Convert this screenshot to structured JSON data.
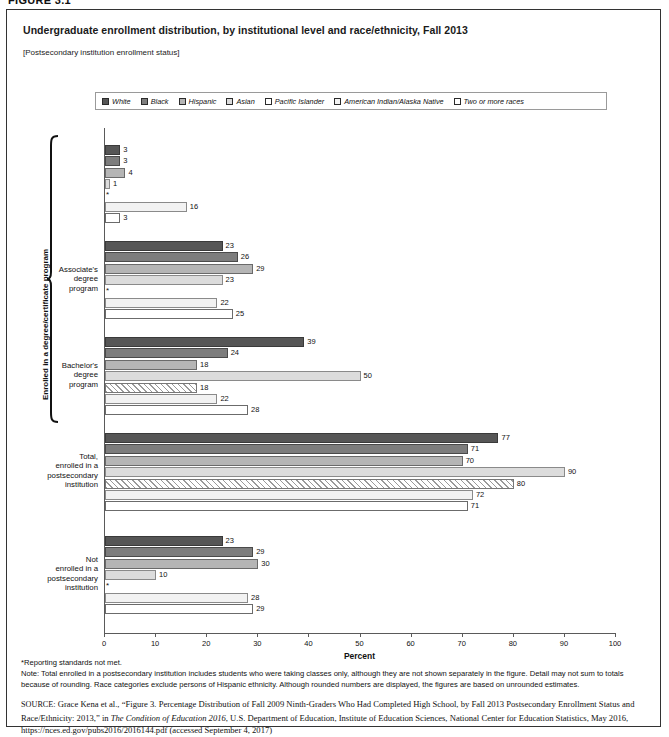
{
  "figure_tag": "FIGURE 3.1",
  "title": "Undergraduate enrollment distribution, by institutional level and race/ethnicity, Fall 2013",
  "subtitle": "[Postsecondary institution enrollment status]",
  "legend": {
    "items": [
      {
        "label": "White",
        "color": "#565656",
        "pattern": "solid"
      },
      {
        "label": "Black",
        "color": "#7d7d7d",
        "pattern": "solid"
      },
      {
        "label": "Hispanic",
        "color": "#b5b5b5",
        "pattern": "solid"
      },
      {
        "label": "Asian",
        "color": "#dcdcdc",
        "pattern": "solid"
      },
      {
        "label": "Pacific Islander",
        "color": "#ffffff",
        "pattern": "diagonal-hatch"
      },
      {
        "label": "American Indian/Alaska Native",
        "color": "#f2f2f2",
        "pattern": "solid"
      },
      {
        "label": "Two or more races",
        "color": "#ffffff",
        "pattern": "solid"
      }
    ]
  },
  "bracket_label": "Enrolled in a degree/certificate program",
  "axis": {
    "title": "Percent",
    "ticks": [
      "0",
      "10",
      "20",
      "30",
      "40",
      "50",
      "60",
      "70",
      "80",
      "90",
      "100"
    ],
    "min": 0,
    "max": 100
  },
  "notes": {
    "star": "*Reporting standards not met.",
    "body": "Note: Total enrolled in a postsecondary institution includes students who were taking classes only, although they are not shown separately in the figure. Detail may not sum to totals because of rounding. Race categories exclude persons of Hispanic ethnicity. Although rounded numbers are displayed, the figures are based on unrounded estimates."
  },
  "source": {
    "prefix": "SOURCE:",
    "part1": " Grace Kena et al., “Figure 3. Percentage Distribution of Fall 2009 Ninth-Graders Who Had Completed High School, by Fall 2013 Postsecondary Enrollment Status and Race/Ethnicity: 2013,” in ",
    "italic": "The Condition of Education 2016",
    "part2": ", U.S. Department of Education, Institute of Education Sciences, National Center for Education Statistics, May 2016, https://nces.ed.gov/pubs2016/2016144.pdf (accessed September 4, 2017)"
  },
  "chart_data": {
    "type": "bar",
    "orientation": "horizontal",
    "title": "Undergraduate enrollment distribution, by institutional level and race/ethnicity, Fall 2013",
    "xlabel": "Percent",
    "ylabel": "",
    "xlim": [
      0,
      100
    ],
    "grid": false,
    "legend_position": "top",
    "series_names": [
      "White",
      "Black",
      "Hispanic",
      "Asian",
      "Pacific Islander",
      "American Indian/Alaska Native",
      "Two or more races"
    ],
    "categories": [
      "",
      "Associate's\ndegree\nprogram",
      "Bachelor's\ndegree\nprogram",
      "Total,\nenrolled in a\npostsecondary\ninstitution",
      "Not\nenrolled in a\npostsecondary\ninstitution"
    ],
    "groups": [
      {
        "label": "",
        "values": [
          3,
          3,
          4,
          1,
          null,
          16,
          3
        ],
        "value_labels": [
          "3",
          "3",
          "4",
          "1",
          "*",
          "16",
          "3"
        ]
      },
      {
        "label": "Associate's\ndegree\nprogram",
        "values": [
          23,
          26,
          29,
          23,
          null,
          22,
          25
        ],
        "value_labels": [
          "23",
          "26",
          "29",
          "23",
          "*",
          "22",
          "25"
        ]
      },
      {
        "label": "Bachelor's\ndegree\nprogram",
        "values": [
          39,
          24,
          18,
          50,
          18,
          22,
          28
        ],
        "value_labels": [
          "39",
          "24",
          "18",
          "50",
          "18",
          "22",
          "28"
        ]
      },
      {
        "label": "Total,\nenrolled in a\npostsecondary\ninstitution",
        "values": [
          77,
          71,
          70,
          90,
          80,
          72,
          71
        ],
        "value_labels": [
          "77",
          "71",
          "70",
          "90",
          "80",
          "72",
          "71"
        ]
      },
      {
        "label": "Not\nenrolled in a\npostsecondary\ninstitution",
        "values": [
          23,
          29,
          30,
          10,
          null,
          28,
          29
        ],
        "value_labels": [
          "23",
          "29",
          "30",
          "10",
          "*",
          "28",
          "29"
        ]
      }
    ]
  }
}
